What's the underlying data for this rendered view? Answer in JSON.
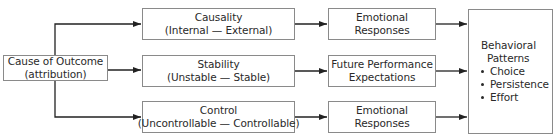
{
  "diagram": {
    "source": {
      "line1": "Cause of Outcome",
      "line2": "(attribution)"
    },
    "dimensions": [
      {
        "title": "Causality",
        "range": "(Internal — External)"
      },
      {
        "title": "Stability",
        "range": "(Unstable — Stable)"
      },
      {
        "title": "Control",
        "range": "(Uncontrollable — Controllable)"
      }
    ],
    "consequences": [
      {
        "line1": "Emotional",
        "line2": "Responses"
      },
      {
        "line1": "Future Performance",
        "line2": "Expectations"
      },
      {
        "line1": "Emotional",
        "line2": "Responses"
      }
    ],
    "outcome": {
      "line1": "Behavioral",
      "line2": "Patterns",
      "items": [
        "Choice",
        "Persistence",
        "Effort"
      ]
    },
    "colors": {
      "line": "#222222",
      "border": "#8a8a8a"
    }
  }
}
